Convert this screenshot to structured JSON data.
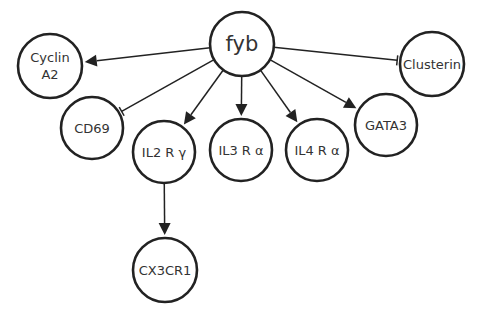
{
  "diagram": {
    "type": "gene-interaction-network",
    "nodes": [
      {
        "id": "fyb",
        "label": "fyb",
        "lines": [
          "fyb"
        ],
        "cx": 242,
        "cy": 44,
        "r": 32,
        "font_size": 21
      },
      {
        "id": "cyclin_a2",
        "label": "Cyclin A2",
        "lines": [
          "Cyclin",
          "A2"
        ],
        "cx": 50,
        "cy": 66,
        "r": 32,
        "font_size": 13
      },
      {
        "id": "cd69",
        "label": "CD69",
        "lines": [
          "CD69"
        ],
        "cx": 92,
        "cy": 128,
        "r": 31,
        "font_size": 13
      },
      {
        "id": "il2rg",
        "label": "IL2 R γ",
        "lines": [
          "IL2 R γ"
        ],
        "cx": 164,
        "cy": 152,
        "r": 31,
        "font_size": 13
      },
      {
        "id": "il3ra",
        "label": "IL3 R α",
        "lines": [
          "IL3 R α"
        ],
        "cx": 241,
        "cy": 150,
        "r": 31,
        "font_size": 13
      },
      {
        "id": "il4ra",
        "label": "IL4 R α",
        "lines": [
          "IL4 R α"
        ],
        "cx": 317,
        "cy": 150,
        "r": 31,
        "font_size": 13
      },
      {
        "id": "gata3",
        "label": "GATA3",
        "lines": [
          "GATA3"
        ],
        "cx": 386,
        "cy": 125,
        "r": 31,
        "font_size": 13
      },
      {
        "id": "clusterin",
        "label": "Clusterin",
        "lines": [
          "Clusterin"
        ],
        "cx": 432,
        "cy": 64,
        "r": 32,
        "font_size": 13
      },
      {
        "id": "cx3cr1",
        "label": "CX3CR1",
        "lines": [
          "CX3CR1"
        ],
        "cx": 165,
        "cy": 270,
        "r": 32,
        "font_size": 13
      }
    ],
    "edges": [
      {
        "from": "fyb",
        "to": "cyclin_a2",
        "type": "activation"
      },
      {
        "from": "fyb",
        "to": "cd69",
        "type": "inhibition"
      },
      {
        "from": "fyb",
        "to": "il2rg",
        "type": "activation"
      },
      {
        "from": "fyb",
        "to": "il3ra",
        "type": "activation"
      },
      {
        "from": "fyb",
        "to": "il4ra",
        "type": "activation"
      },
      {
        "from": "fyb",
        "to": "gata3",
        "type": "activation"
      },
      {
        "from": "fyb",
        "to": "clusterin",
        "type": "inhibition"
      },
      {
        "from": "il2rg",
        "to": "cx3cr1",
        "type": "activation"
      }
    ],
    "colors": {
      "stroke": "#222222",
      "text": "#333333",
      "background": "#ffffff"
    }
  }
}
